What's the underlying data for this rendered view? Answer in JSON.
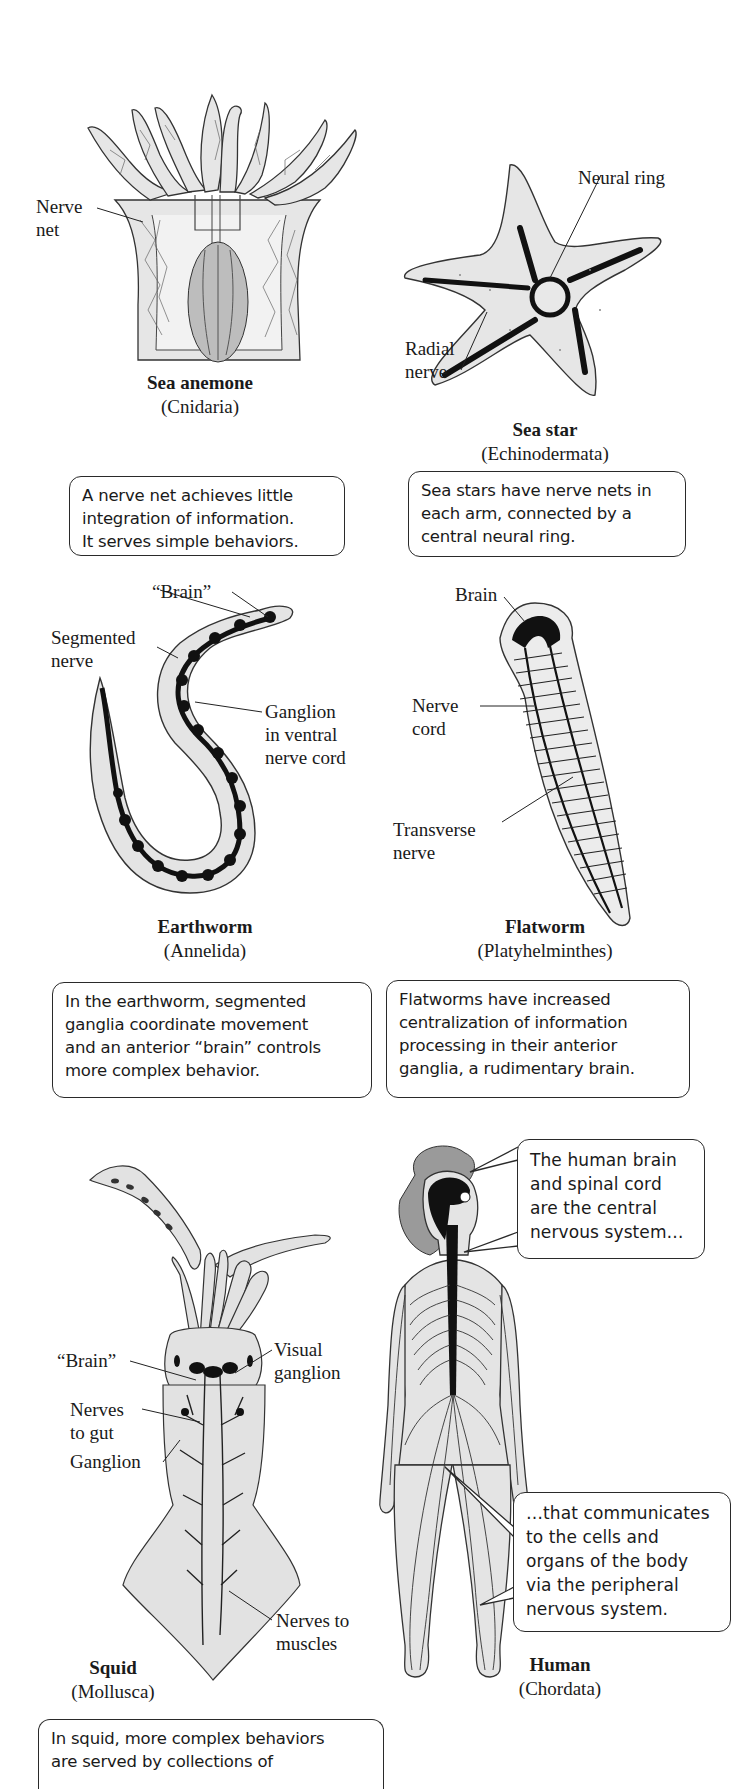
{
  "figure": {
    "panels": [
      {
        "id": "sea-anemone",
        "name": "Sea anemone",
        "phylum": "(Cnidaria)",
        "labels": [
          "Nerve\nnet"
        ],
        "description": "A nerve net achieves little\nintegration of information.\nIt serves simple behaviors."
      },
      {
        "id": "sea-star",
        "name": "Sea star",
        "phylum": "(Echinodermata)",
        "labels": [
          "Neural ring",
          "Radial\nnerve"
        ],
        "description": "Sea stars have nerve nets in\neach arm, connected by a\ncentral neural ring."
      },
      {
        "id": "earthworm",
        "name": "Earthworm",
        "phylum": "(Annelida)",
        "labels": [
          "“Brain”",
          "Segmented\nnerve",
          "Ganglion\nin ventral\nnerve cord"
        ],
        "description": "In the earthworm, segmented\nganglia coordinate movement\nand an anterior “brain” controls\nmore complex behavior."
      },
      {
        "id": "flatworm",
        "name": "Flatworm",
        "phylum": "(Platyhelminthes)",
        "labels": [
          "Brain",
          "Nerve\ncord",
          "Transverse\nnerve"
        ],
        "description": "Flatworms have increased\ncentralization of information\nprocessing in their anterior\nganglia, a rudimentary brain."
      },
      {
        "id": "squid",
        "name": "Squid",
        "phylum": "(Mollusca)",
        "labels": [
          "“Brain”",
          "Visual\nganglion",
          "Nerves\nto gut",
          "Ganglion",
          "Nerves to\nmuscles"
        ],
        "description": "In squid, more complex behaviors\nare served by collections of"
      },
      {
        "id": "human",
        "name": "Human",
        "phylum": "(Chordata)",
        "callouts": [
          "The human brain\nand spinal cord\nare the central\nnervous system…",
          "…that communicates\nto the cells and\norgans of the body\nvia the peripheral\nnervous system."
        ]
      }
    ]
  },
  "colors": {
    "ink": "#1a1a1a",
    "body_fill": "#e4e4e4",
    "nerve": "#111111",
    "box_border": "#2a2a2a"
  }
}
